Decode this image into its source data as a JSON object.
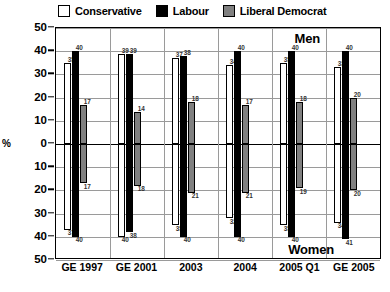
{
  "legend": {
    "items": [
      {
        "label": "Conservative",
        "color": "#ffffff",
        "icon": "legend-swatch-conservative"
      },
      {
        "label": "Labour",
        "color": "#000000",
        "icon": "legend-swatch-labour"
      },
      {
        "label": "Liberal Democrat",
        "color": "#808080",
        "icon": "legend-swatch-liberal-democrat"
      }
    ]
  },
  "axis": {
    "y_label": "%",
    "y_ticks_top": [
      "50",
      "40",
      "30",
      "20",
      "10",
      "0"
    ],
    "y_ticks_bottom": [
      "10",
      "20",
      "30",
      "40",
      "50"
    ]
  },
  "sections": {
    "top_label": "Men",
    "bottom_label": "Women"
  },
  "chart_data": {
    "type": "bar",
    "title": "",
    "subtitle": "",
    "xlabel": "",
    "ylabel": "%",
    "orientation": "vertical",
    "layout": "mirrored-diverging",
    "grid": true,
    "legend_position": "top",
    "ylim": [
      -50,
      50
    ],
    "y_tick_interval": 10,
    "categories": [
      "GE 1997",
      "GE 2001",
      "2003",
      "2004",
      "2005 Q1",
      "GE 2005"
    ],
    "panels": [
      {
        "name": "Men",
        "direction": "up",
        "series": [
          {
            "name": "Conservative",
            "color": "#ffffff",
            "values": [
              35,
              39,
              37,
              34,
              35,
              33
            ]
          },
          {
            "name": "Labour",
            "color": "#000000",
            "values": [
              40,
              39,
              38,
              40,
              40,
              40
            ]
          },
          {
            "name": "Liberal Democrat",
            "color": "#808080",
            "values": [
              17,
              14,
              18,
              17,
              18,
              20
            ]
          }
        ]
      },
      {
        "name": "Women",
        "direction": "down",
        "series": [
          {
            "name": "Conservative",
            "color": "#ffffff",
            "values": [
              37,
              40,
              35,
              32,
              35,
              34
            ]
          },
          {
            "name": "Labour",
            "color": "#000000",
            "values": [
              40,
              38,
              40,
              40,
              40,
              41
            ]
          },
          {
            "name": "Liberal Democrat",
            "color": "#808080",
            "values": [
              17,
              18,
              21,
              21,
              19,
              20
            ]
          }
        ]
      }
    ]
  }
}
